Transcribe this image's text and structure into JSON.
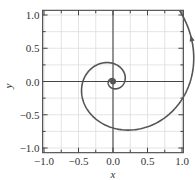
{
  "chart_data": {
    "type": "line",
    "title": "",
    "xlabel": "x",
    "ylabel": "y",
    "xlim": [
      -1.0,
      1.0
    ],
    "ylim": [
      -1.0,
      1.0
    ],
    "grid": true,
    "x_ticks": [
      "-1.0",
      "-0.5",
      "0.0",
      "0.5",
      "1.0"
    ],
    "y_ticks": [
      "1.0",
      "0.5",
      "0.0",
      "-0.5",
      "-1.0"
    ],
    "x_tick_values": [
      -1.0,
      -0.5,
      0.0,
      0.5,
      1.0
    ],
    "y_tick_values": [
      1.0,
      0.5,
      0.0,
      -0.5,
      -1.0
    ],
    "series": [
      {
        "name": "spiral",
        "description": "Logarithmic spiral growing outward from origin, counter-clockwise, with arrow indicating direction; exits top near x=0.72",
        "equation": "r = 0.17 * exp(0.3 * theta)",
        "key_points": [
          {
            "x": 0.0,
            "y": 0.0,
            "label": "origin (start point)"
          },
          {
            "x": 0.17,
            "y": 0.0
          },
          {
            "x": 0.0,
            "y": 0.27
          },
          {
            "x": -0.45,
            "y": 0.0
          },
          {
            "x": 0.0,
            "y": -0.72
          },
          {
            "x": 0.97,
            "y": 0.0
          },
          {
            "x": 0.72,
            "y": 1.0
          }
        ],
        "color": "#555555"
      }
    ],
    "annotations": [
      "arrowhead on outer arc near (0.95, 0.55)"
    ],
    "legend": "none"
  },
  "colors": {
    "curve": "#555555",
    "axes": "#444444",
    "grid": "#dddddd",
    "frame": "#555555"
  }
}
